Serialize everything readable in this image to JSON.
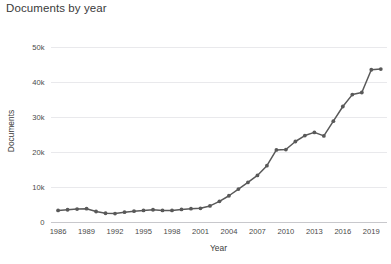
{
  "chart_data": {
    "type": "line",
    "title": "Documents by year",
    "xlabel": "Year",
    "ylabel": "Documents",
    "xlim": [
      1985.2,
      2020.6
    ],
    "ylim": [
      0,
      52000
    ],
    "grid": true,
    "legend": false,
    "line_color": "#595959",
    "marker_color": "#595959",
    "grid_color": "#e9e9ec",
    "axis_color": "#c8c8cc",
    "y_tick_labels": [
      "0",
      "10k",
      "20k",
      "30k",
      "40k",
      "50k"
    ],
    "y_tick_values": [
      0,
      10000,
      20000,
      30000,
      40000,
      50000
    ],
    "x_tick_labels": [
      "1986",
      "1989",
      "1992",
      "1995",
      "1998",
      "2001",
      "2004",
      "2007",
      "2010",
      "2013",
      "2016",
      "2019"
    ],
    "x_tick_values": [
      1986,
      1989,
      1992,
      1995,
      1998,
      2001,
      2004,
      2007,
      2010,
      2013,
      2016,
      2019
    ],
    "x": [
      1986,
      1987,
      1988,
      1989,
      1990,
      1991,
      1992,
      1993,
      1994,
      1995,
      1996,
      1997,
      1998,
      1999,
      2000,
      2001,
      2002,
      2003,
      2004,
      2005,
      2006,
      2007,
      2008,
      2009,
      2010,
      2011,
      2012,
      2013,
      2014,
      2015,
      2016,
      2017,
      2018,
      2019,
      2020
    ],
    "values": [
      3300,
      3500,
      3700,
      3800,
      3000,
      2500,
      2400,
      2800,
      3100,
      3300,
      3500,
      3300,
      3300,
      3600,
      3800,
      3900,
      4600,
      5900,
      7500,
      9400,
      11300,
      13300,
      16100,
      20600,
      20700,
      23000,
      24700,
      25600,
      24600,
      28800,
      33000,
      36400,
      37000,
      43500,
      43700
    ]
  }
}
